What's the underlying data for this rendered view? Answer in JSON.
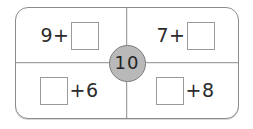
{
  "widget": {
    "type": "fact-family-number-bond",
    "total": "10",
    "colors": {
      "frame_border": "#8c8c8c",
      "box_border": "#9a9a9a",
      "circle_fill": "#b9b9b9",
      "circle_border": "#7d7d7d",
      "text": "#2b2b2b",
      "background": "#ffffff"
    },
    "cells": [
      {
        "position": "top-left",
        "layout": "number-first",
        "leading_text": "9+",
        "trailing_text": "",
        "answer_value": ""
      },
      {
        "position": "top-right",
        "layout": "number-first",
        "leading_text": "7+",
        "trailing_text": "",
        "answer_value": ""
      },
      {
        "position": "bottom-left",
        "layout": "box-first",
        "leading_text": "",
        "trailing_text": "+6",
        "answer_value": ""
      },
      {
        "position": "bottom-right",
        "layout": "box-first",
        "leading_text": "",
        "trailing_text": "+8",
        "answer_value": ""
      }
    ]
  }
}
